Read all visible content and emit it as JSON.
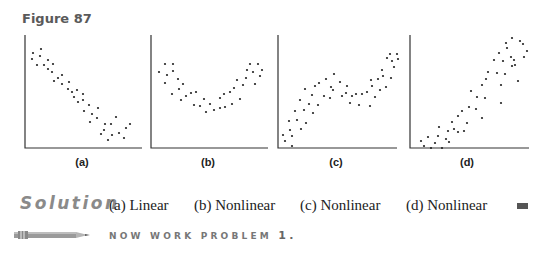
{
  "figure": {
    "title": "Figure 87"
  },
  "chart_data": [
    {
      "type": "scatter",
      "label": "(a)",
      "title": "",
      "xlabel": "",
      "ylabel": "",
      "grid": false,
      "axis_ranges": {
        "x": [
          0,
          118
        ],
        "y": [
          0,
          113
        ]
      },
      "description": "Points decreasing linearly from upper-left to lower-right",
      "points": [
        [
          7,
          19
        ],
        [
          15,
          15
        ],
        [
          6,
          25
        ],
        [
          14,
          22
        ],
        [
          11,
          31
        ],
        [
          18,
          31
        ],
        [
          22,
          26
        ],
        [
          22,
          35
        ],
        [
          27,
          30
        ],
        [
          26,
          38
        ],
        [
          32,
          44
        ],
        [
          28,
          47
        ],
        [
          36,
          41
        ],
        [
          36,
          50
        ],
        [
          42,
          55
        ],
        [
          43,
          48
        ],
        [
          46,
          58
        ],
        [
          48,
          63
        ],
        [
          51,
          56
        ],
        [
          52,
          68
        ],
        [
          57,
          60
        ],
        [
          57,
          66
        ],
        [
          58,
          77
        ],
        [
          63,
          71
        ],
        [
          66,
          80
        ],
        [
          64,
          88
        ],
        [
          71,
          84
        ],
        [
          72,
          74
        ],
        [
          79,
          90
        ],
        [
          78,
          96
        ],
        [
          85,
          90
        ],
        [
          86,
          101
        ],
        [
          93,
          99
        ],
        [
          90,
          83
        ],
        [
          100,
          94
        ],
        [
          104,
          90
        ],
        [
          98,
          104
        ],
        [
          75,
          100
        ],
        [
          82,
          106
        ]
      ]
    },
    {
      "type": "scatter",
      "label": "(b)",
      "title": "",
      "xlabel": "",
      "ylabel": "",
      "grid": false,
      "axis_ranges": {
        "x": [
          0,
          118
        ],
        "y": [
          0,
          113
        ]
      },
      "description": "U-shaped (parabolic) pattern of points",
      "points": [
        [
          7,
          38
        ],
        [
          13,
          30
        ],
        [
          21,
          30
        ],
        [
          15,
          41
        ],
        [
          21,
          37
        ],
        [
          13,
          49
        ],
        [
          26,
          45
        ],
        [
          27,
          55
        ],
        [
          20,
          60
        ],
        [
          31,
          50
        ],
        [
          29,
          66
        ],
        [
          34,
          62
        ],
        [
          39,
          59
        ],
        [
          42,
          71
        ],
        [
          44,
          58
        ],
        [
          48,
          72
        ],
        [
          52,
          65
        ],
        [
          54,
          78
        ],
        [
          58,
          70
        ],
        [
          62,
          76
        ],
        [
          68,
          64
        ],
        [
          68,
          74
        ],
        [
          72,
          60
        ],
        [
          73,
          73
        ],
        [
          78,
          58
        ],
        [
          80,
          70
        ],
        [
          82,
          54
        ],
        [
          85,
          46
        ],
        [
          88,
          65
        ],
        [
          91,
          51
        ],
        [
          94,
          44
        ],
        [
          95,
          36
        ],
        [
          98,
          30
        ],
        [
          101,
          38
        ],
        [
          103,
          50
        ],
        [
          106,
          30
        ],
        [
          108,
          42
        ],
        [
          110,
          36
        ]
      ]
    },
    {
      "type": "scatter",
      "label": "(c)",
      "title": "",
      "xlabel": "",
      "ylabel": "",
      "grid": false,
      "axis_ranges": {
        "x": [
          0,
          118
        ],
        "y": [
          0,
          113
        ]
      },
      "description": "Wavy nonlinear pattern: rise, dip, then rise",
      "points": [
        [
          4,
          101
        ],
        [
          6,
          107
        ],
        [
          10,
          87
        ],
        [
          11,
          96
        ],
        [
          13,
          112
        ],
        [
          13,
          102
        ],
        [
          16,
          77
        ],
        [
          18,
          86
        ],
        [
          21,
          66
        ],
        [
          22,
          95
        ],
        [
          25,
          76
        ],
        [
          26,
          55
        ],
        [
          27,
          89
        ],
        [
          30,
          70
        ],
        [
          33,
          61
        ],
        [
          34,
          79
        ],
        [
          36,
          52
        ],
        [
          39,
          71
        ],
        [
          40,
          49
        ],
        [
          45,
          62
        ],
        [
          47,
          45
        ],
        [
          51,
          64
        ],
        [
          52,
          53
        ],
        [
          54,
          56
        ],
        [
          55,
          40
        ],
        [
          61,
          48
        ],
        [
          63,
          62
        ],
        [
          67,
          59
        ],
        [
          68,
          52
        ],
        [
          71,
          69
        ],
        [
          73,
          62
        ],
        [
          77,
          60
        ],
        [
          80,
          71
        ],
        [
          83,
          60
        ],
        [
          88,
          58
        ],
        [
          91,
          72
        ],
        [
          92,
          46
        ],
        [
          93,
          52
        ],
        [
          96,
          63
        ],
        [
          99,
          45
        ],
        [
          101,
          56
        ],
        [
          103,
          36
        ],
        [
          104,
          42
        ],
        [
          107,
          53
        ],
        [
          108,
          24
        ],
        [
          111,
          20
        ],
        [
          112,
          44
        ],
        [
          113,
          27
        ],
        [
          115,
          33
        ],
        [
          118,
          20
        ],
        [
          119,
          25
        ]
      ]
    },
    {
      "type": "scatter",
      "label": "(d)",
      "title": "",
      "xlabel": "",
      "ylabel": "",
      "grid": false,
      "axis_ranges": {
        "x": [
          0,
          120
        ],
        "y": [
          0,
          113
        ]
      },
      "description": "Curved (exponential-like) increasing pattern",
      "points": [
        [
          10,
          107
        ],
        [
          13,
          112
        ],
        [
          17,
          103
        ],
        [
          20,
          114
        ],
        [
          24,
          109
        ],
        [
          27,
          102
        ],
        [
          28,
          93
        ],
        [
          31,
          114
        ],
        [
          35,
          105
        ],
        [
          37,
          97
        ],
        [
          38,
          108
        ],
        [
          41,
          88
        ],
        [
          43,
          95
        ],
        [
          47,
          98
        ],
        [
          47,
          82
        ],
        [
          51,
          77
        ],
        [
          53,
          97
        ],
        [
          56,
          89
        ],
        [
          58,
          73
        ],
        [
          60,
          57
        ],
        [
          65,
          75
        ],
        [
          66,
          63
        ],
        [
          71,
          51
        ],
        [
          71,
          84
        ],
        [
          74,
          64
        ],
        [
          75,
          45
        ],
        [
          77,
          38
        ],
        [
          83,
          26
        ],
        [
          86,
          39
        ],
        [
          88,
          19
        ],
        [
          90,
          69
        ],
        [
          90,
          51
        ],
        [
          92,
          27
        ],
        [
          94,
          40
        ],
        [
          95,
          9
        ],
        [
          96,
          14
        ],
        [
          100,
          23
        ],
        [
          101,
          32
        ],
        [
          101,
          4
        ],
        [
          103,
          26
        ],
        [
          104,
          31
        ],
        [
          107,
          47
        ],
        [
          109,
          7
        ],
        [
          112,
          10
        ],
        [
          113,
          23
        ],
        [
          116,
          17
        ]
      ]
    }
  ],
  "solution": {
    "heading": "Solution",
    "answers": [
      {
        "label": "(a)",
        "text": "Linear"
      },
      {
        "label": "(b)",
        "text": "Nonlinear"
      },
      {
        "label": "(c)",
        "text": "Nonlinear"
      },
      {
        "label": "(d)",
        "text": "Nonlinear"
      }
    ]
  },
  "exercise_prompt": {
    "icon": "pencil-icon",
    "text": "NOW WORK PROBLEM",
    "number": "1."
  },
  "colors": {
    "figure_title": "#5a5a5a",
    "solution_heading": "#8a8a8a",
    "axes": "#333333",
    "points": "#222222",
    "end_mark": "#555555"
  }
}
